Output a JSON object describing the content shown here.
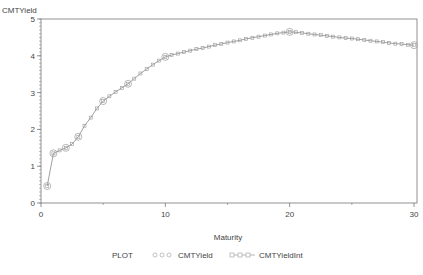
{
  "chart_data": {
    "type": "line",
    "title": "",
    "xlabel": "Maturity",
    "ylabel": "CMTYield",
    "xlim": [
      0,
      30
    ],
    "ylim": [
      0,
      5
    ],
    "x_ticks": [
      0,
      10,
      20,
      30
    ],
    "x_minor_ticks": [
      5,
      15,
      25
    ],
    "y_ticks": [
      0,
      1,
      2,
      3,
      4,
      5
    ],
    "grid": false,
    "legend_position": "bottom",
    "legend_title": "PLOT",
    "series": [
      {
        "name": "CMTYield",
        "marker": "circle",
        "x": [
          0.5,
          1,
          2,
          3,
          5,
          7,
          10,
          20,
          30
        ],
        "values": [
          0.46,
          1.35,
          1.5,
          1.8,
          2.77,
          3.24,
          3.97,
          4.65,
          4.29
        ]
      },
      {
        "name": "CMTYieldInt",
        "marker": "square",
        "x": [
          0.5,
          1,
          1.5,
          2,
          2.5,
          3,
          3.5,
          4,
          4.5,
          5,
          5.5,
          6,
          6.5,
          7,
          7.5,
          8,
          8.5,
          9,
          9.5,
          10,
          10.5,
          11,
          11.5,
          12,
          12.5,
          13,
          13.5,
          14,
          14.5,
          15,
          15.5,
          16,
          16.5,
          17,
          17.5,
          18,
          18.5,
          19,
          19.5,
          20,
          20.5,
          21,
          21.5,
          22,
          22.5,
          23,
          23.5,
          24,
          24.5,
          25,
          25.5,
          26,
          26.5,
          27,
          27.5,
          28,
          28.5,
          29,
          29.5,
          30
        ],
        "values": [
          0.46,
          1.35,
          1.43,
          1.5,
          1.6,
          1.8,
          2.1,
          2.32,
          2.57,
          2.77,
          2.9,
          3.02,
          3.13,
          3.24,
          3.38,
          3.52,
          3.64,
          3.76,
          3.87,
          3.97,
          4.02,
          4.06,
          4.1,
          4.14,
          4.18,
          4.21,
          4.25,
          4.29,
          4.32,
          4.36,
          4.39,
          4.42,
          4.46,
          4.49,
          4.52,
          4.55,
          4.58,
          4.61,
          4.63,
          4.65,
          4.64,
          4.62,
          4.6,
          4.58,
          4.56,
          4.54,
          4.52,
          4.5,
          4.48,
          4.47,
          4.45,
          4.43,
          4.41,
          4.39,
          4.37,
          4.35,
          4.33,
          4.32,
          4.3,
          4.29
        ]
      }
    ]
  },
  "labels": {
    "y_axis_label": "CMTYield",
    "x_axis_label": "Maturity",
    "legend_title": "PLOT",
    "legend_series_1": "CMTYield",
    "legend_series_2": "CMTYieldInt"
  },
  "colors": {
    "line": "#888888",
    "axis": "#777777",
    "marker": "#999999"
  }
}
